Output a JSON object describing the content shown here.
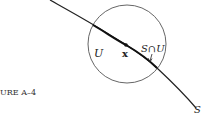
{
  "figure": {
    "caption": "URE  A–4",
    "labels": {
      "set_u": "U",
      "point_x": "x",
      "intersection": "S∩U",
      "curve_s": "S"
    },
    "colors": {
      "stroke": "#222222",
      "circle": "#555555",
      "background": "#ffffff"
    }
  }
}
